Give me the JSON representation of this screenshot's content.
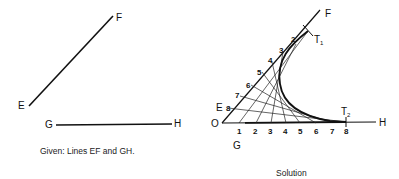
{
  "given": {
    "caption": "Given: Lines EF and GH.",
    "labels": {
      "E": "E",
      "F": "F",
      "G": "G",
      "H": "H"
    }
  },
  "solution": {
    "caption": "Solution",
    "labels": {
      "O": "O",
      "E": "E",
      "F": "F",
      "G": "G",
      "H": "H",
      "T1": "T",
      "T1_sub": "1",
      "T2": "T",
      "T2_sub": "2"
    },
    "oh_ticks": [
      "1",
      "2",
      "3",
      "4",
      "5",
      "6",
      "7",
      "8"
    ],
    "of_ticks": [
      "8",
      "7",
      "6",
      "5",
      "4",
      "3",
      "2"
    ]
  }
}
